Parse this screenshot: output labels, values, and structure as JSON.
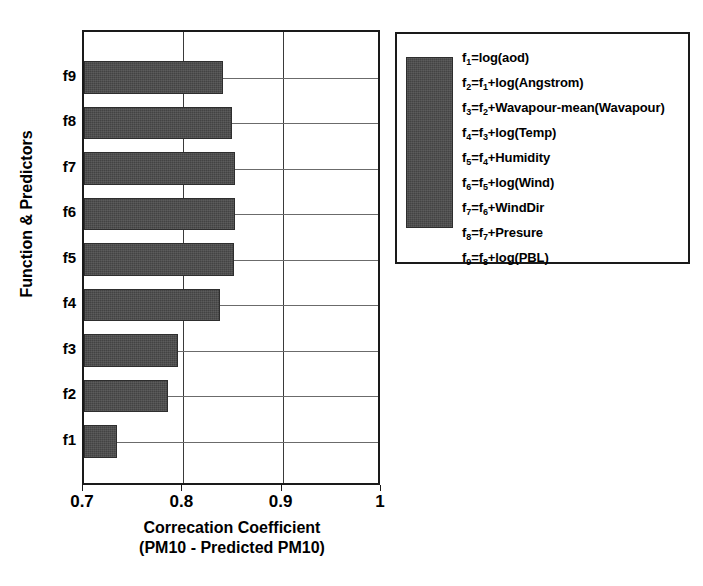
{
  "chart_data": {
    "type": "bar",
    "orientation": "horizontal",
    "title": "",
    "xlabel": "Correcation Coefficient",
    "xlabel_line2": "(PM10 - Predicted PM10)",
    "ylabel": "Function & Predictors",
    "categories": [
      "f1",
      "f2",
      "f3",
      "f4",
      "f5",
      "f6",
      "f7",
      "f8",
      "f9"
    ],
    "values": [
      0.733,
      0.785,
      0.795,
      0.837,
      0.851,
      0.852,
      0.852,
      0.849,
      0.84
    ],
    "xlim": [
      0.7,
      1.0
    ],
    "xticks": [
      0.7,
      0.8,
      0.9,
      1.0
    ],
    "xtick_labels": [
      "0.7",
      "0.8",
      "0.9",
      "1"
    ],
    "grid": true,
    "bar_color": "#4a4a4a",
    "axis_color": "#1a1a1a",
    "legend_position": "outside-right"
  },
  "legend": {
    "swatch_color": "#4a4a4a",
    "entries": [
      {
        "lhs": "f",
        "lhs_sub": "1",
        "rhs": "=log(aod)",
        "rhs_sub": "",
        "rhs_tail": ""
      },
      {
        "lhs": "f",
        "lhs_sub": "2",
        "rhs": "=f",
        "rhs_sub": "1",
        "rhs_tail": "+log(Angstrom)"
      },
      {
        "lhs": "f",
        "lhs_sub": "3",
        "rhs": "=f",
        "rhs_sub": "2",
        "rhs_tail": "+Wavapour-mean(Wavapour)"
      },
      {
        "lhs": "f",
        "lhs_sub": "4",
        "rhs": "=f",
        "rhs_sub": "3",
        "rhs_tail": "+log(Temp)"
      },
      {
        "lhs": "f",
        "lhs_sub": "5",
        "rhs": "=f",
        "rhs_sub": "4",
        "rhs_tail": "+Humidity"
      },
      {
        "lhs": "f",
        "lhs_sub": "6",
        "rhs": "=f",
        "rhs_sub": "5",
        "rhs_tail": "+log(Wind)"
      },
      {
        "lhs": "f",
        "lhs_sub": "7",
        "rhs": "=f",
        "rhs_sub": "6",
        "rhs_tail": "+WindDir"
      },
      {
        "lhs": "f",
        "lhs_sub": "8",
        "rhs": "=f",
        "rhs_sub": "7",
        "rhs_tail": "+Presure"
      },
      {
        "lhs": "f",
        "lhs_sub": "9",
        "rhs": "=f",
        "rhs_sub": "8",
        "rhs_tail": "+log(PBL)"
      }
    ]
  }
}
